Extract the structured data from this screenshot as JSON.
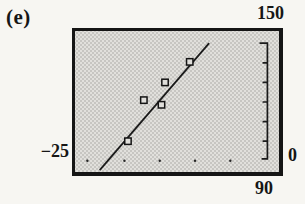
{
  "labels": {
    "figure": "(e)",
    "ymax": "150",
    "xmin": "−25",
    "ymin": "0",
    "xmax": "90"
  },
  "colors": {
    "ink": "#1a1a1a",
    "screen_gray": "#e1e0dc",
    "stipple_dot": "#c7c6c2",
    "paper": "#f7f6f2"
  },
  "chart_data": {
    "type": "scatter",
    "title": "",
    "xlabel": "",
    "ylabel": "",
    "legend": "none",
    "grid": false,
    "window": {
      "xmin": -25,
      "xmax": 90,
      "xscl": 20,
      "ymin": 0,
      "ymax": 150,
      "yscl": 20
    },
    "points": [
      [
        5,
        33
      ],
      [
        14,
        77
      ],
      [
        24,
        72
      ],
      [
        26,
        96
      ],
      [
        40,
        118
      ]
    ],
    "trend_line": {
      "x1": -11,
      "y1": 2,
      "x2": 51,
      "y2": 138
    },
    "x_axis_dots": [
      -18,
      3,
      23,
      43,
      63
    ],
    "x_axis_dots_y": 12,
    "y_ruler": {
      "x_at": 84,
      "y_from": 14,
      "y_to": 138,
      "ticks": [
        33,
        54,
        75,
        96,
        117
      ]
    }
  }
}
